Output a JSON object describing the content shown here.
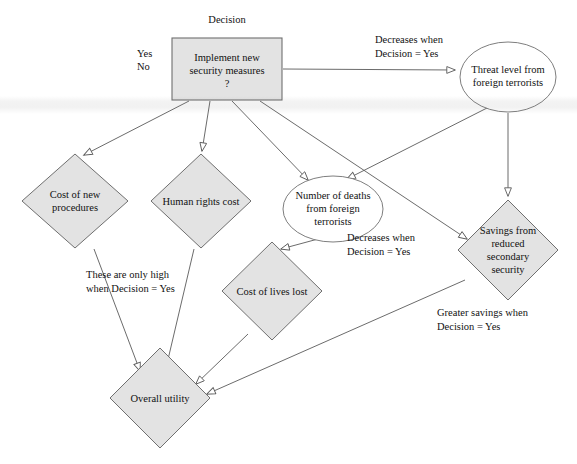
{
  "diagram": {
    "style": {
      "node_fill": "#e3e3e3",
      "node_stroke": "#6f6f6f",
      "ellipse_fill": "#ffffff",
      "edge_color": "#5a5a5a",
      "background": "#ffffff"
    },
    "nodes": [
      {
        "id": "decision",
        "shape": "rectangle",
        "label": "Implement new\nsecurity measures\n?",
        "caption": "Decision",
        "options": [
          "Yes",
          "No"
        ],
        "x": 172,
        "y": 38,
        "w": 110,
        "h": 62
      },
      {
        "id": "threat-level",
        "shape": "ellipse",
        "label": "Threat level from\nforeign terrorists",
        "cx": 508,
        "cy": 77,
        "rx": 48,
        "ry": 35
      },
      {
        "id": "cost-new-procedures",
        "shape": "diamond",
        "label": "Cost of new\nprocedures",
        "cx": 75,
        "cy": 201,
        "rx": 53,
        "ry": 47
      },
      {
        "id": "human-rights-cost",
        "shape": "diamond",
        "label": "Human rights cost",
        "cx": 201,
        "cy": 201,
        "rx": 50,
        "ry": 47
      },
      {
        "id": "number-of-deaths",
        "shape": "ellipse",
        "label": "Number of deaths\nfrom foreign\nterrorists",
        "cx": 333,
        "cy": 209,
        "rx": 50,
        "ry": 33
      },
      {
        "id": "savings-reduced-security",
        "shape": "diamond",
        "label": "Savings from\nreduced\nsecondary\nsecurity",
        "cx": 508,
        "cy": 250,
        "rx": 50,
        "ry": 50
      },
      {
        "id": "cost-of-lives-lost",
        "shape": "diamond",
        "label": "Cost of lives lost",
        "cx": 272,
        "cy": 291,
        "rx": 50,
        "ry": 49
      },
      {
        "id": "overall-utility",
        "shape": "diamond",
        "label": "Overall utility",
        "cx": 160,
        "cy": 398,
        "rx": 50,
        "ry": 50
      }
    ],
    "annotations": [
      {
        "id": "decision-options-yes",
        "text": "Yes",
        "x": 137,
        "y": 53
      },
      {
        "id": "decision-options-no",
        "text": "No",
        "x": 137,
        "y": 66
      },
      {
        "id": "decision-caption",
        "text": "Decision",
        "x": 204,
        "y": 20
      },
      {
        "id": "threat-decrease-note",
        "text": "Decreases when\nDecision = Yes",
        "x": 375,
        "y": 37
      },
      {
        "id": "deaths-decrease-note",
        "text": "Decreases when\nDecision = Yes",
        "x": 347,
        "y": 235
      },
      {
        "id": "costs-high-note",
        "text": "These are only high\nwhen Decision = Yes",
        "x": 86,
        "y": 272
      },
      {
        "id": "savings-greater-note",
        "text": "Greater savings when\nDecision = Yes",
        "x": 437,
        "y": 310
      }
    ],
    "edges": [
      {
        "from": "decision",
        "to": "threat-level"
      },
      {
        "from": "decision",
        "to": "cost-new-procedures"
      },
      {
        "from": "decision",
        "to": "human-rights-cost"
      },
      {
        "from": "decision",
        "to": "number-of-deaths"
      },
      {
        "from": "decision",
        "to": "savings-reduced-security"
      },
      {
        "from": "threat-level",
        "to": "number-of-deaths"
      },
      {
        "from": "threat-level",
        "to": "savings-reduced-security"
      },
      {
        "from": "number-of-deaths",
        "to": "cost-of-lives-lost"
      },
      {
        "from": "cost-new-procedures",
        "to": "overall-utility"
      },
      {
        "from": "human-rights-cost",
        "to": "overall-utility"
      },
      {
        "from": "cost-of-lives-lost",
        "to": "overall-utility"
      },
      {
        "from": "savings-reduced-security",
        "to": "overall-utility"
      }
    ]
  }
}
